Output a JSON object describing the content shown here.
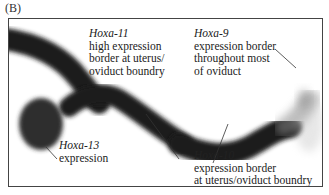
{
  "panel_label": "(B)",
  "colors": {
    "stain_dark": "#1a1a1a",
    "hoxa13_blob": "#2e2e2e",
    "frame": "#444444",
    "background": "#ffffff"
  },
  "labels": {
    "hoxa11": {
      "gene": "Hoxa-11",
      "lines": [
        "high expression",
        "border at uterus/",
        "oviduct boundry"
      ]
    },
    "hoxa9": {
      "gene": "Hoxa-9",
      "lines": [
        "expression border",
        "throughout most",
        "of oviduct"
      ]
    },
    "hoxa13": {
      "gene": "Hoxa-13",
      "lines": [
        "expression"
      ]
    },
    "hoxa10": {
      "gene": "Hoxa-10",
      "lines": [
        "expression border",
        "at uterus/oviduct boundry"
      ]
    }
  }
}
